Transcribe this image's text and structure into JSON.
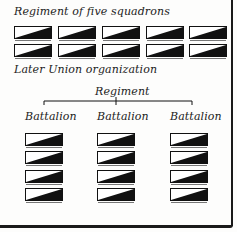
{
  "top": {
    "title": "Regiment of five squadrons",
    "rows": 2,
    "cols": 5
  },
  "bottom": {
    "title": "Later Union organization",
    "parent_label": "Regiment",
    "battalions": [
      {
        "label": "Battalion",
        "squadrons": 4
      },
      {
        "label": "Battalion",
        "squadrons": 4
      },
      {
        "label": "Battalion",
        "squadrons": 4
      }
    ]
  },
  "colors": {
    "ink": "#111111",
    "paper": "#fdfdfc"
  },
  "icons": {
    "squadron": "diagonal-split-flag-icon"
  }
}
